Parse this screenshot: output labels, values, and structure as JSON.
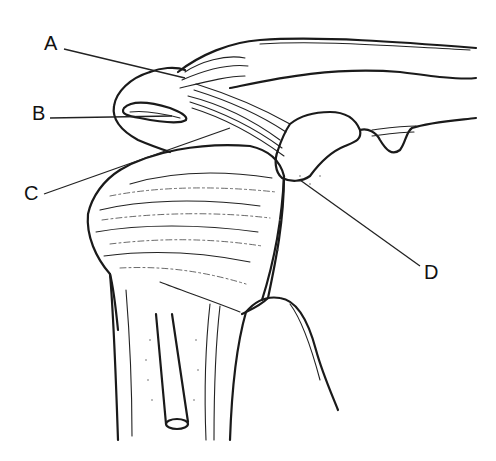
{
  "figure": {
    "labels": [
      {
        "id": "A",
        "text": "A",
        "x": 44,
        "y": 33
      },
      {
        "id": "B",
        "text": "B",
        "x": 32,
        "y": 103
      },
      {
        "id": "C",
        "text": "C",
        "x": 24,
        "y": 183
      },
      {
        "id": "D",
        "text": "D",
        "x": 424,
        "y": 262
      }
    ]
  },
  "colors": {
    "background": "#ffffff",
    "ink": "#1a1a1a"
  }
}
